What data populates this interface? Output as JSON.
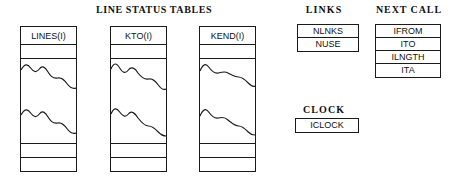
{
  "diagram": {
    "sections": {
      "line_status": {
        "title": "LINE STATUS TABLES",
        "columns": [
          {
            "name": "col-lines",
            "header": "LINES(I)"
          },
          {
            "name": "col-kto",
            "header": "KTO(I)"
          },
          {
            "name": "col-kend",
            "header": "KEND(I)"
          }
        ]
      },
      "links": {
        "title": "LINKS",
        "rows": [
          "NLNKS",
          "NUSE"
        ]
      },
      "next_call": {
        "title": "NEXT CALL",
        "rows": [
          "IFROM",
          "ITO",
          "ILNGTH",
          "ITA"
        ]
      },
      "clock": {
        "title": "CLOCK",
        "rows": [
          "ICLOCK"
        ]
      }
    },
    "colors": {
      "background": "#ffffff",
      "stroke": "#1a1a1a",
      "text": "#111111"
    }
  }
}
